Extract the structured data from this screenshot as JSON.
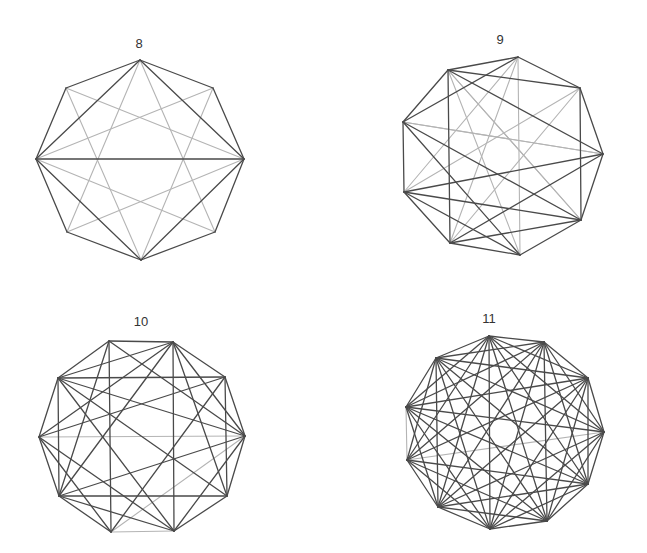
{
  "colors": {
    "dark": "#4a4a4a",
    "light": "#b4b4b4",
    "label": "#333333",
    "background": "#ffffff"
  },
  "figures": [
    {
      "label": "8",
      "label_pos": [
        139,
        48
      ],
      "vertices": [
        [
          140,
          60
        ],
        [
          213,
          88
        ],
        [
          244,
          159
        ],
        [
          215,
          232
        ],
        [
          141,
          260
        ],
        [
          67,
          232
        ],
        [
          36,
          159
        ],
        [
          66,
          88
        ]
      ],
      "dark_edges": [
        [
          0,
          1
        ],
        [
          1,
          2
        ],
        [
          2,
          3
        ],
        [
          3,
          4
        ],
        [
          4,
          5
        ],
        [
          5,
          6
        ],
        [
          6,
          7
        ],
        [
          7,
          0
        ],
        [
          0,
          2
        ],
        [
          2,
          4
        ],
        [
          4,
          6
        ],
        [
          6,
          0
        ],
        [
          2,
          6
        ]
      ],
      "light_edges": [
        [
          0,
          3
        ],
        [
          3,
          6
        ],
        [
          6,
          1
        ],
        [
          1,
          4
        ],
        [
          4,
          7
        ],
        [
          7,
          2
        ],
        [
          2,
          5
        ],
        [
          5,
          0
        ]
      ]
    },
    {
      "label": "9",
      "label_pos": [
        500,
        44
      ],
      "vertices": [
        [
          518,
          57
        ],
        [
          580,
          88
        ],
        [
          603,
          154
        ],
        [
          581,
          220
        ],
        [
          520,
          255
        ],
        [
          450,
          243
        ],
        [
          404,
          192
        ],
        [
          403,
          122
        ],
        [
          448,
          70
        ]
      ],
      "dark_edges": [
        [
          0,
          1
        ],
        [
          1,
          2
        ],
        [
          2,
          3
        ],
        [
          3,
          4
        ],
        [
          4,
          5
        ],
        [
          5,
          6
        ],
        [
          6,
          7
        ],
        [
          7,
          8
        ],
        [
          8,
          0
        ],
        [
          8,
          5
        ],
        [
          1,
          3
        ],
        [
          8,
          1
        ],
        [
          8,
          2
        ],
        [
          0,
          7
        ],
        [
          7,
          3
        ],
        [
          6,
          2
        ],
        [
          5,
          2
        ],
        [
          5,
          3
        ],
        [
          4,
          6
        ],
        [
          4,
          7
        ],
        [
          3,
          6
        ],
        [
          0,
          5
        ],
        [
          1,
          6
        ]
      ],
      "light_edges": [
        [
          0,
          4
        ],
        [
          1,
          5
        ],
        [
          2,
          7
        ],
        [
          3,
          8
        ],
        [
          4,
          8
        ],
        [
          5,
          0
        ],
        [
          6,
          1
        ],
        [
          7,
          2
        ],
        [
          8,
          3
        ],
        [
          0,
          6
        ]
      ]
    },
    {
      "label": "10",
      "label_pos": [
        141,
        326
      ],
      "vertices": [
        [
          109,
          341
        ],
        [
          173,
          342
        ],
        [
          225,
          377
        ],
        [
          245,
          436
        ],
        [
          227,
          496
        ],
        [
          174,
          531
        ],
        [
          111,
          532
        ],
        [
          59,
          496
        ],
        [
          39,
          437
        ],
        [
          58,
          378
        ]
      ],
      "dark_edges": [
        [
          0,
          1
        ],
        [
          1,
          2
        ],
        [
          2,
          3
        ],
        [
          3,
          4
        ],
        [
          4,
          5
        ],
        [
          6,
          7
        ],
        [
          7,
          8
        ],
        [
          8,
          9
        ],
        [
          9,
          0
        ],
        [
          9,
          2
        ],
        [
          9,
          1
        ],
        [
          1,
          5
        ],
        [
          9,
          7
        ],
        [
          7,
          4
        ],
        [
          1,
          3
        ],
        [
          1,
          4
        ],
        [
          1,
          8
        ],
        [
          1,
          7
        ],
        [
          0,
          3
        ],
        [
          0,
          6
        ],
        [
          9,
          3
        ],
        [
          9,
          4
        ],
        [
          9,
          5
        ],
        [
          2,
          4
        ],
        [
          2,
          6
        ],
        [
          7,
          3
        ],
        [
          7,
          5
        ],
        [
          8,
          5
        ],
        [
          3,
          5
        ],
        [
          0,
          7
        ],
        [
          2,
          8
        ],
        [
          8,
          6
        ]
      ],
      "light_edges": [
        [
          8,
          3
        ],
        [
          6,
          3
        ],
        [
          5,
          6
        ]
      ]
    },
    {
      "label": "11",
      "label_pos": [
        489,
        323
      ],
      "vertices": [
        [
          489,
          336
        ],
        [
          544,
          342
        ],
        [
          588,
          378
        ],
        [
          604,
          432
        ],
        [
          588,
          484
        ],
        [
          547,
          521
        ],
        [
          490,
          529
        ],
        [
          438,
          507
        ],
        [
          407,
          460
        ],
        [
          406,
          407
        ],
        [
          436,
          358
        ]
      ],
      "complete": true,
      "light_edges": [
        [
          8,
          3
        ],
        [
          8,
          9
        ]
      ]
    }
  ]
}
